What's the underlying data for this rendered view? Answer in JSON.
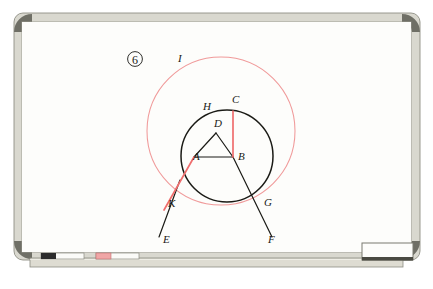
{
  "scene": {
    "kind": "photo-of-whiteboard",
    "background_color": "#ffffff"
  },
  "whiteboard": {
    "frame_color": "#d9d8cf",
    "frame_edge_color": "#8f8f85",
    "corner_color": "#6f6f66",
    "surface_color": "#fdfdfb",
    "tray": {
      "color": "#dedcd2",
      "edge_color": "#8c8c82",
      "items": [
        {
          "name": "black-marker",
          "cap_color": "#2b2b2b",
          "body_color": "#fbfbf8"
        },
        {
          "name": "red-marker",
          "cap_color": "#f0a6a6",
          "body_color": "#fbfbf8"
        },
        {
          "name": "eraser",
          "body_color": "#fdfdfb",
          "base_color": "#4a4a42"
        }
      ]
    }
  },
  "drawing": {
    "figure_number": "6",
    "black_ink": "#1b1b16",
    "red_ink": "#ef6e6e",
    "red_circle_ink": "#f09a9a",
    "outer_circle": {
      "label": "I",
      "cx": 221,
      "cy": 131,
      "r": 74,
      "color": "#f09a9a"
    },
    "inner_circle": {
      "cx": 227,
      "cy": 156,
      "r": 46,
      "color": "#1b1b16"
    },
    "points": [
      {
        "label": "I",
        "x": 178,
        "y": 62,
        "role": "outer-circle-label"
      },
      {
        "label": "H",
        "x": 203,
        "y": 110,
        "role": "arc-label"
      },
      {
        "label": "C",
        "x": 232,
        "y": 103,
        "role": "circle-top-point"
      },
      {
        "label": "D",
        "x": 214,
        "y": 127,
        "role": "triangle-apex"
      },
      {
        "label": "A",
        "x": 193,
        "y": 160,
        "role": "triangle-left"
      },
      {
        "label": "B",
        "x": 238,
        "y": 160,
        "role": "triangle-right"
      },
      {
        "label": "K",
        "x": 168,
        "y": 207,
        "role": "chord-intersection"
      },
      {
        "label": "G",
        "x": 264,
        "y": 206,
        "role": "chord-intersection"
      },
      {
        "label": "E",
        "x": 163,
        "y": 243,
        "role": "ray-end"
      },
      {
        "label": "F",
        "x": 268,
        "y": 243,
        "role": "ray-end"
      }
    ],
    "segments": [
      {
        "name": "segment-BC",
        "from": "B",
        "to": "C",
        "color": "red",
        "x1": 233,
        "y1": 157,
        "x2": 233,
        "y2": 111
      },
      {
        "name": "segment-AK",
        "from": "A",
        "to": "K",
        "color": "red",
        "x1": 194,
        "y1": 157,
        "x2": 167,
        "y2": 203
      },
      {
        "name": "segment-AB",
        "from": "A",
        "to": "B",
        "color": "black",
        "x1": 194,
        "y1": 157,
        "x2": 233,
        "y2": 157
      },
      {
        "name": "segment-AD",
        "from": "A",
        "to": "D",
        "color": "black",
        "x1": 194,
        "y1": 157,
        "x2": 216,
        "y2": 133
      },
      {
        "name": "segment-DB",
        "from": "D",
        "to": "B",
        "color": "black",
        "x1": 216,
        "y1": 133,
        "x2": 233,
        "y2": 157
      },
      {
        "name": "ray-KE",
        "from": "K",
        "to": "E",
        "color": "black",
        "x1": 167,
        "y1": 203,
        "x2": 159,
        "y2": 237
      },
      {
        "name": "ray-BF",
        "from": "B",
        "to": "F",
        "color": "black",
        "x1": 233,
        "y1": 157,
        "x2": 272,
        "y2": 237
      }
    ]
  }
}
